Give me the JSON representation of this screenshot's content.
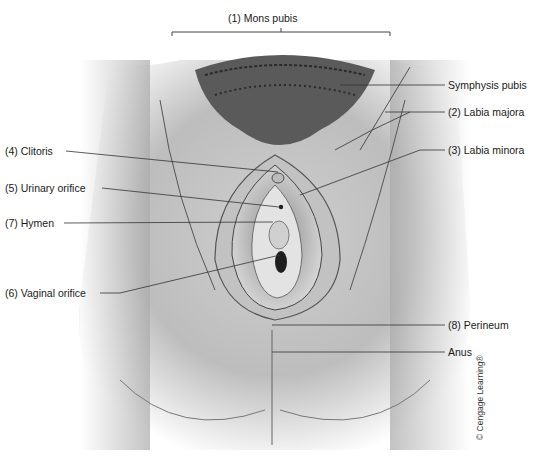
{
  "diagram": {
    "title_bracket_label": "(1) Mons pubis",
    "labels_right": [
      {
        "id": "symphysis-pubis",
        "text": "Symphysis pubis"
      },
      {
        "id": "labia-majora",
        "text": "(2) Labia majora"
      },
      {
        "id": "labia-minora",
        "text": "(3) Labia minora"
      },
      {
        "id": "perineum",
        "text": "(8) Perineum"
      },
      {
        "id": "anus",
        "text": "Anus"
      }
    ],
    "labels_left": [
      {
        "id": "clitoris",
        "text": "(4) Clitoris"
      },
      {
        "id": "urinary-orifice",
        "text": "(5) Urinary orifice"
      },
      {
        "id": "hymen",
        "text": "(7) Hymen"
      },
      {
        "id": "vaginal-orifice",
        "text": "(6) Vaginal orifice"
      }
    ],
    "credit": "© Cengage Learning®"
  }
}
